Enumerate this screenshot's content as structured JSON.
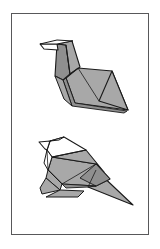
{
  "page": {
    "background_color": "#ffffff",
    "width": 160,
    "height": 249
  },
  "panel": {
    "name": "figure-plate",
    "border_color": "#58585a",
    "fill_color": "#ffffff",
    "x": 11,
    "y": 13,
    "width": 138,
    "height": 222
  },
  "palette": {
    "paper_front": "#a8a8a8",
    "paper_front_dark": "#8f8f8f",
    "paper_back": "#ffffff",
    "outline": "#1a1a1a",
    "outline_soft": "#3c3c3c",
    "panel_border": "#58585a",
    "background": "#ffffff"
  },
  "figures": [
    {
      "id": "figure-top",
      "name": "origami-bird-step-1",
      "label": "",
      "description": "Folded paper bird with raised head, pointed beak to the left and a large flat wing-body panel sweeping down to the right.",
      "fill": "#a8a8a8",
      "parts": [
        {
          "name": "beak",
          "fill": "#ffffff"
        },
        {
          "name": "head",
          "fill": "#a8a8a8"
        },
        {
          "name": "neck",
          "fill": "#8f8f8f"
        },
        {
          "name": "breast",
          "fill": "#a8a8a8"
        },
        {
          "name": "wing-body",
          "fill": "#a8a8a8"
        },
        {
          "name": "tail-tip",
          "fill": "#a8a8a8"
        }
      ]
    },
    {
      "id": "figure-bottom",
      "name": "origami-bird-step-2",
      "label": "",
      "description": "Completed paper bird standing on folded feet, white crest and head, grey body and a long tapering tail to the lower right.",
      "fill": "#a8a8a8",
      "parts": [
        {
          "name": "beak",
          "fill": "#ffffff"
        },
        {
          "name": "crest",
          "fill": "#ffffff"
        },
        {
          "name": "head",
          "fill": "#ffffff"
        },
        {
          "name": "back",
          "fill": "#a8a8a8"
        },
        {
          "name": "body",
          "fill": "#a8a8a8"
        },
        {
          "name": "wing",
          "fill": "#8f8f8f"
        },
        {
          "name": "tail",
          "fill": "#a8a8a8"
        },
        {
          "name": "leg",
          "fill": "#a8a8a8"
        },
        {
          "name": "foot",
          "fill": "#a8a8a8"
        }
      ]
    }
  ]
}
